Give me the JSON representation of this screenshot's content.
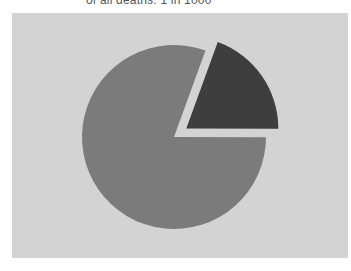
{
  "caption": "of all deaths: 1 in 1000",
  "colors": {
    "panel": "#d3d3d3",
    "main_slice": "#7b7b7b",
    "exploded_slice": "#3e3e3e"
  },
  "chart_data": {
    "type": "pie",
    "title": "of all deaths: 1 in 1000",
    "categories": [
      "Other",
      "Highlighted share"
    ],
    "values": [
      80.5,
      19.5
    ],
    "exploded": [
      false,
      true
    ],
    "start_angle_deg": -70,
    "legend": "none",
    "grid": false
  }
}
